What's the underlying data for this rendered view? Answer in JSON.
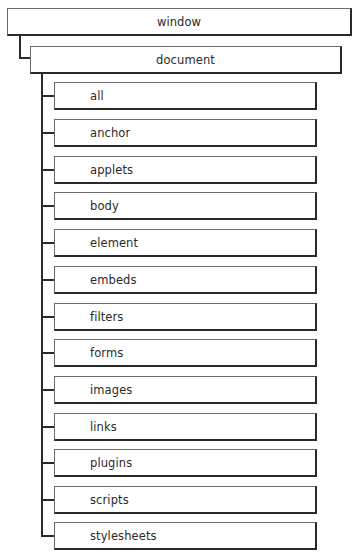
{
  "diagram": {
    "root": {
      "label": "window",
      "child": {
        "label": "document",
        "children": [
          {
            "label": "all"
          },
          {
            "label": "anchor"
          },
          {
            "label": "applets"
          },
          {
            "label": "body"
          },
          {
            "label": "element"
          },
          {
            "label": "embeds"
          },
          {
            "label": "filters"
          },
          {
            "label": "forms"
          },
          {
            "label": "images"
          },
          {
            "label": "links"
          },
          {
            "label": "plugins"
          },
          {
            "label": "scripts"
          },
          {
            "label": "stylesheets"
          }
        ]
      }
    }
  }
}
